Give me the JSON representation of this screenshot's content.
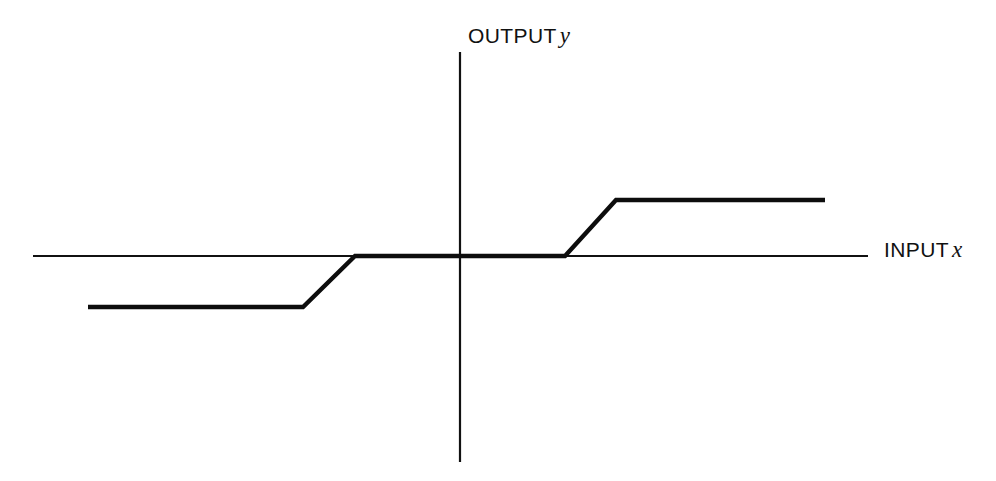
{
  "figure": {
    "background_color": "#ffffff",
    "ink_color": "#111111",
    "width": 996,
    "height": 481
  },
  "labels": {
    "y_axis_name": "OUTPUT",
    "y_axis_symbol": "y",
    "x_axis_name": "INPUT",
    "x_axis_symbol": "x"
  },
  "chart_data": {
    "type": "line",
    "title": "",
    "xlabel": "INPUT x",
    "ylabel": "OUTPUT y",
    "grid": false,
    "legend": false,
    "xlim": [
      -5,
      5
    ],
    "ylim": [
      -2.5,
      2.5
    ],
    "axes": {
      "x_axis_pixels": {
        "x1": 33,
        "y1": 256,
        "x2": 868,
        "y2": 256
      },
      "y_axis_pixels": {
        "x1": 460,
        "y1": 52,
        "x2": 460,
        "y2": 462
      },
      "origin_pixels": {
        "x": 460,
        "y": 256
      }
    },
    "series": [
      {
        "name": "transfer characteristic",
        "points_pixels": [
          {
            "x": 88,
            "y": 307
          },
          {
            "x": 303,
            "y": 307
          },
          {
            "x": 355,
            "y": 256
          },
          {
            "x": 565,
            "y": 256
          },
          {
            "x": 616,
            "y": 200
          },
          {
            "x": 825,
            "y": 200
          }
        ],
        "x": [
          -4.6,
          -2.0,
          -1.3,
          1.3,
          1.9,
          4.5
        ],
        "values": [
          -1.0,
          -1.0,
          0.0,
          0.0,
          1.0,
          1.0
        ]
      }
    ],
    "annotations": [
      {
        "label": "negative saturation plateau",
        "y": -1.0
      },
      {
        "label": "dead zone",
        "x_range": [
          -1.3,
          1.3
        ],
        "y": 0.0
      },
      {
        "label": "positive saturation plateau",
        "y": 1.0
      }
    ]
  }
}
